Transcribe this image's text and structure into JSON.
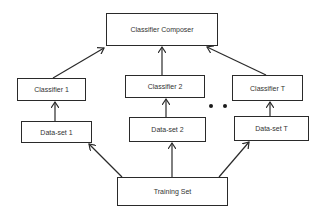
{
  "diagram": {
    "type": "ensemble-architecture-flow",
    "nodes": {
      "composer": {
        "label": "Classifier Composer"
      },
      "classifier_1": {
        "label": "Classifier 1"
      },
      "classifier_2": {
        "label": "Classifier 2"
      },
      "classifier_t": {
        "label": "Classifier T"
      },
      "dataset_1": {
        "label": "Data-set 1"
      },
      "dataset_2": {
        "label": "Data-set 2"
      },
      "dataset_t": {
        "label": "Data-set T"
      },
      "training_set": {
        "label": "Training Set"
      }
    },
    "ellipsis": "• •",
    "edges": [
      {
        "from": "Training Set",
        "to": "Data-set 1"
      },
      {
        "from": "Training Set",
        "to": "Data-set 2"
      },
      {
        "from": "Training Set",
        "to": "Data-set T"
      },
      {
        "from": "Data-set 1",
        "to": "Classifier 1"
      },
      {
        "from": "Data-set 2",
        "to": "Classifier 2"
      },
      {
        "from": "Data-set T",
        "to": "Classifier T"
      },
      {
        "from": "Classifier 1",
        "to": "Classifier Composer"
      },
      {
        "from": "Classifier 2",
        "to": "Classifier Composer"
      },
      {
        "from": "Classifier T",
        "to": "Classifier Composer"
      }
    ],
    "colors": {
      "stroke": "#2a2a2a",
      "text": "#333333",
      "background": "#ffffff"
    }
  }
}
